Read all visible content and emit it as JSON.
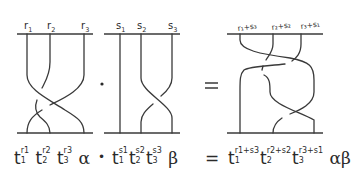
{
  "diagram": {
    "left_braid": {
      "labels": [
        {
          "main": "r",
          "sub": "1"
        },
        {
          "main": "r",
          "sub": "2"
        },
        {
          "main": "r",
          "sub": "3"
        }
      ]
    },
    "product_symbol": "•",
    "middle_braid": {
      "labels": [
        {
          "main": "s",
          "sub": "1"
        },
        {
          "main": "s",
          "sub": "2"
        },
        {
          "main": "s",
          "sub": "3"
        }
      ]
    },
    "equals_symbol": "=",
    "right_braid": {
      "labels": [
        {
          "text": "r₁+s₃"
        },
        {
          "text": "r₂+s₂"
        },
        {
          "text": "r₃+s₁"
        }
      ]
    }
  },
  "formula": {
    "lhs1": {
      "terms": [
        {
          "base": "t",
          "sup": "r1",
          "sub": "1"
        },
        {
          "base": "t",
          "sup": "r2",
          "sub": "2"
        },
        {
          "base": "t",
          "sup": "r3",
          "sub": "3"
        }
      ],
      "suffix": "α"
    },
    "dot": "•",
    "lhs2": {
      "terms": [
        {
          "base": "t",
          "sup": "s1",
          "sub": "1"
        },
        {
          "base": "t",
          "sup": "s2",
          "sub": "2"
        },
        {
          "base": "t",
          "sup": "s3",
          "sub": "3"
        }
      ],
      "suffix": "β"
    },
    "equals": "=",
    "rhs": {
      "terms": [
        {
          "base": "t",
          "sup": "r1+s3",
          "sub": "1"
        },
        {
          "base": "t",
          "sup": "r2+s2",
          "sub": "2"
        },
        {
          "base": "t",
          "sup": "r3+s1",
          "sub": "3"
        }
      ],
      "suffix": "αβ"
    }
  }
}
